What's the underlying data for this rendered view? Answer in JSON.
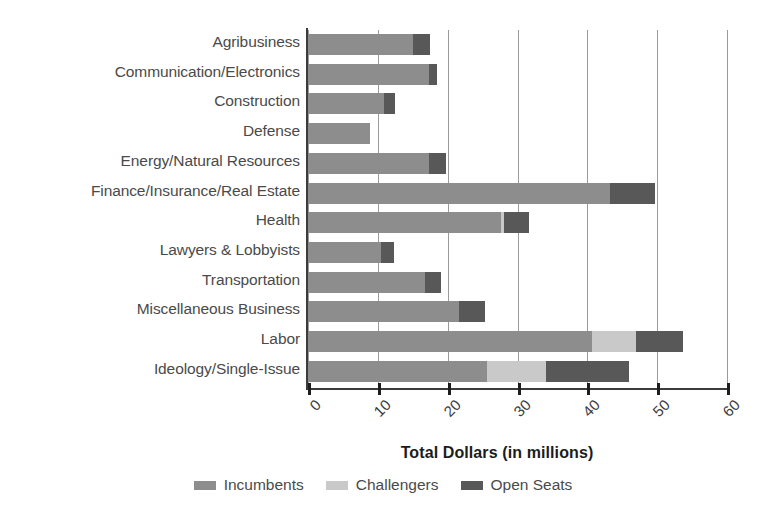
{
  "chart_data": {
    "type": "bar",
    "orientation": "horizontal",
    "stacked": true,
    "title": "",
    "xlabel": "Total Dollars (in millions)",
    "ylabel": "",
    "xlim": [
      0,
      60
    ],
    "xticks": [
      0,
      10,
      20,
      30,
      40,
      50,
      60
    ],
    "xticklabels": [
      "0",
      "10",
      "20",
      "30",
      "40",
      "50",
      "60"
    ],
    "grid": "vertical",
    "legend_position": "bottom",
    "categories": [
      "Agribusiness",
      "Communication/Electronics",
      "Construction",
      "Defense",
      "Energy/Natural Resources",
      "Finance/Insurance/Real Estate",
      "Health",
      "Lawyers & Lobbyists",
      "Transportation",
      "Miscellaneous Business",
      "Labor",
      "Ideology/Single-Issue"
    ],
    "series": [
      {
        "name": "Incumbents",
        "color": "#8d8d8d",
        "values": [
          15.0,
          17.3,
          10.9,
          8.9,
          17.3,
          43.3,
          27.7,
          10.4,
          16.7,
          21.6,
          40.7,
          25.6
        ]
      },
      {
        "name": "Challengers",
        "color": "#c9c9c9",
        "values": [
          0.0,
          0.0,
          0.0,
          0.0,
          0.0,
          0.0,
          0.4,
          0.0,
          0.0,
          0.0,
          6.2,
          8.5
        ]
      },
      {
        "name": "Open Seats",
        "color": "#585858",
        "values": [
          2.5,
          1.2,
          1.6,
          0.0,
          2.4,
          6.4,
          3.6,
          1.9,
          2.3,
          3.8,
          6.8,
          11.9
        ]
      }
    ],
    "totals": [
      17.5,
      18.5,
      12.5,
      8.9,
      19.7,
      49.7,
      31.7,
      12.3,
      19.0,
      25.4,
      53.7,
      46.0
    ]
  },
  "legend": {
    "items": [
      {
        "label": "Incumbents",
        "color": "#8d8d8d"
      },
      {
        "label": "Challengers",
        "color": "#c9c9c9"
      },
      {
        "label": "Open Seats",
        "color": "#585858"
      }
    ]
  },
  "axis": {
    "x_title": "Total Dollars (in millions)"
  }
}
